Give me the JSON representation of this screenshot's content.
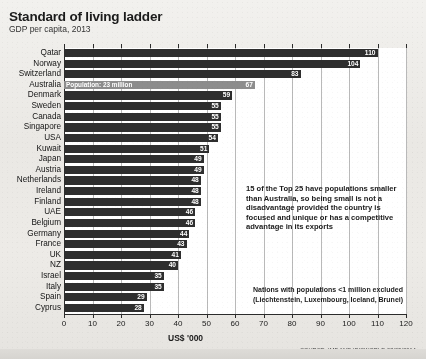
{
  "header": {
    "title": "Standard of living ladder",
    "subtitle": "GDP per capita, 2013"
  },
  "axis": {
    "xlabel": "US$ '000",
    "ticks": [
      "0",
      "10",
      "20",
      "30",
      "40",
      "50",
      "60",
      "70",
      "80",
      "90",
      "100",
      "110",
      "120"
    ]
  },
  "source": "SOURCE: IMF AND IBISWORLD 08/05/2014",
  "annotations": {
    "australia_population": "Population: 23 million",
    "callout": "15 of the Top 25 have populations smaller than Australia, so being small is not a disadvantage provided the country is focused and unique or has a competitive advantage in its exports",
    "note_line1": "Nations with populations <1 million excluded",
    "note_line2": "(Liechtenstein, Luxembourg, Iceland, Brunei)"
  },
  "colors": {
    "bar": "#2e2e2e",
    "bar_highlight": "#8d8d8d",
    "background": "#eceae6",
    "plot_background": "#ffffff",
    "grid": "#b9b9b9",
    "axis": "#2b2b2b",
    "value_text": "#ffffff"
  },
  "chart_data": {
    "type": "bar",
    "orientation": "horizontal",
    "title": "Standard of living ladder",
    "subtitle": "GDP per capita, 2013",
    "xlabel": "US$ '000",
    "ylabel": "",
    "xlim": [
      0,
      120
    ],
    "xtick_step": 10,
    "grid": true,
    "legend": "none",
    "highlight_category": "Australia",
    "categories": [
      "Qatar",
      "Norway",
      "Switzerland",
      "Australia",
      "Denmark",
      "Sweden",
      "Canada",
      "Singapore",
      "USA",
      "Kuwait",
      "Japan",
      "Austria",
      "Netherlands",
      "Ireland",
      "Finland",
      "UAE",
      "Belgium",
      "Germany",
      "France",
      "UK",
      "NZ",
      "Israel",
      "Italy",
      "Spain",
      "Cyprus"
    ],
    "values": [
      110,
      104,
      83,
      67,
      59,
      55,
      55,
      55,
      54,
      51,
      49,
      49,
      48,
      48,
      48,
      46,
      46,
      44,
      43,
      41,
      40,
      35,
      35,
      29,
      28
    ]
  }
}
